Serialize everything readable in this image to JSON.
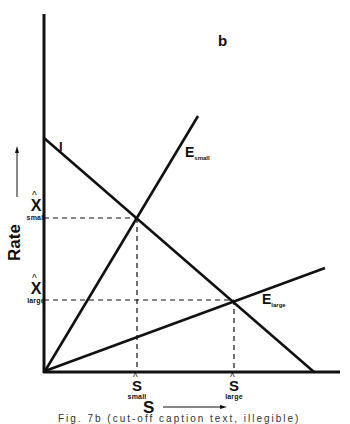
{
  "diagram": {
    "panel_label": "b",
    "y_axis_label": "Rate",
    "x_axis_label": "S",
    "lines": {
      "intake": "I",
      "e_small_main": "E",
      "e_small_sub": "small",
      "e_large_main": "E",
      "e_large_sub": "large"
    },
    "y_ticks": [
      {
        "main": "X",
        "hat": "^",
        "sub": "small"
      },
      {
        "main": "X",
        "hat": "^",
        "sub": "large"
      }
    ],
    "x_ticks": [
      {
        "main": "S",
        "hat": "^",
        "sub": "small"
      },
      {
        "main": "S",
        "hat": "^",
        "sub": "large"
      }
    ],
    "caption": "Fig. 7b  (cut-off caption text, illegible)"
  }
}
